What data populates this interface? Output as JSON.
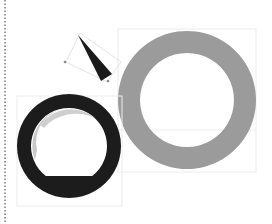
{
  "canvas": {
    "width": 272,
    "height": 224,
    "background": "#ffffff"
  },
  "colors": {
    "ring_gray": "#9b9b9b",
    "ring_dark": "#1c1c1c",
    "crescent": "#c8c8c8",
    "bbox": "#e6e6e6",
    "dots": "#9a9a9a",
    "triangle": "#1a1a1a"
  },
  "shapes": {
    "gray_ring": {
      "cx": 187,
      "cy": 100,
      "outer_r": 69,
      "inner_r": 47,
      "bbox": [
        118,
        29,
        138,
        143
      ],
      "inner_line_y": 130
    },
    "dark_ring": {
      "cx": 69,
      "cy": 146,
      "outer_r": 52,
      "inner_r": 38,
      "chord_y": 176,
      "bbox": [
        17,
        96,
        105,
        110
      ]
    },
    "triangle": {
      "points": "78,35 112,74 101,81",
      "handle_box": "66,62 80,33 121,62 107,82",
      "handles": [
        [
          65,
          62
        ],
        [
          108,
          81
        ]
      ]
    },
    "dotted_line": {
      "x": 5,
      "y1": 0,
      "y2": 224
    }
  }
}
